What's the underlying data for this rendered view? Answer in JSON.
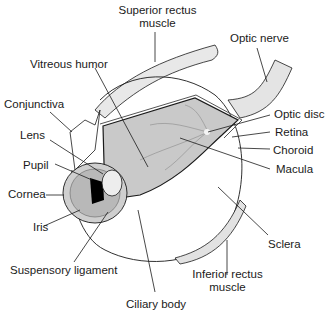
{
  "diagram": {
    "labels": {
      "superior_rectus_1": "Superior rectus",
      "superior_rectus_2": "muscle",
      "optic_nerve": "Optic nerve",
      "vitreous_humor": "Vitreous humor",
      "conjunctiva": "Conjunctiva",
      "lens": "Lens",
      "pupil": "Pupil",
      "cornea": "Cornea",
      "iris": "Iris",
      "suspensory_ligament": "Suspensory ligament",
      "ciliary_body": "Ciliary body",
      "optic_disc": "Optic disc",
      "retina": "Retina",
      "choroid": "Choroid",
      "macula": "Macula",
      "sclera": "Sclera",
      "inferior_rectus_1": "Inferior rectus",
      "inferior_rectus_2": "muscle"
    },
    "colors": {
      "line": "#1a1a1a",
      "interior_fill": "#c9c9c9",
      "muscle_fill": "#e6e6e6",
      "pupil": "#000000"
    }
  }
}
